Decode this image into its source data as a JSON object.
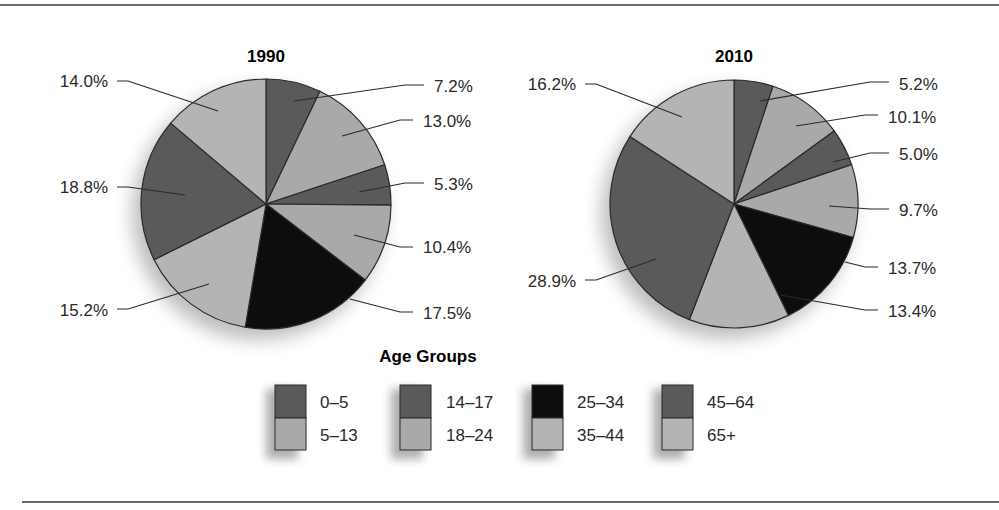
{
  "chart_data": [
    {
      "type": "pie",
      "title": "1990",
      "categories": [
        "0–5",
        "5–13",
        "14–17",
        "18–24",
        "25–34",
        "35–44",
        "45–64",
        "65+"
      ],
      "values": [
        7.2,
        13.0,
        5.3,
        10.4,
        17.5,
        15.2,
        18.8,
        14.0
      ],
      "labels": [
        "7.2%",
        "13.0%",
        "5.3%",
        "10.4%",
        "17.5%",
        "15.2%",
        "18.8%",
        "14.0%"
      ],
      "start_angle": "12 o'clock, clockwise"
    },
    {
      "type": "pie",
      "title": "2010",
      "categories": [
        "0–5",
        "5–13",
        "14–17",
        "18–24",
        "25–34",
        "35–44",
        "45–64",
        "65+"
      ],
      "values": [
        5.2,
        10.1,
        5.0,
        9.7,
        13.7,
        13.4,
        28.9,
        16.2
      ],
      "labels": [
        "5.2%",
        "10.1%",
        "5.0%",
        "9.7%",
        "13.7%",
        "13.4%",
        "28.9%",
        "16.2%"
      ],
      "start_angle": "12 o'clock, clockwise"
    }
  ],
  "legend": {
    "title": "Age Groups",
    "position": "bottom-center",
    "items": [
      {
        "label": "0–5",
        "color": "#5a5a5a"
      },
      {
        "label": "5–13",
        "color": "#a9a9a9"
      },
      {
        "label": "14–17",
        "color": "#5a5a5a"
      },
      {
        "label": "18–24",
        "color": "#a9a9a9"
      },
      {
        "label": "25–34",
        "color": "#0d0d0d"
      },
      {
        "label": "35–44",
        "color": "#b4b4b4"
      },
      {
        "label": "45–64",
        "color": "#5a5a5a"
      },
      {
        "label": "65+",
        "color": "#b4b4b4"
      }
    ]
  },
  "colors": {
    "dark": "#5a5a5a",
    "light": "#a9a9a9",
    "lighter": "#b4b4b4",
    "black": "#0d0d0d",
    "outline": "#2a2a2a",
    "leader": "#2a2a2a"
  }
}
